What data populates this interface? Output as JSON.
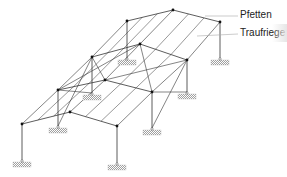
{
  "diagram": {
    "type": "structural-frame-isometric",
    "labels": [
      {
        "id": "pfetten",
        "text": "Pfetten",
        "x": 240,
        "y": 15
      },
      {
        "id": "traufriegel",
        "text": "Traufriege",
        "x": 240,
        "y": 33
      }
    ],
    "colors": {
      "line": "#333333",
      "leader": "#aaaaaa",
      "hatch": "#888888",
      "fade": "#e8e8e8"
    },
    "frames": [
      {
        "name": "front",
        "le": [
          22,
          124
        ],
        "ri": [
          70,
          112
        ],
        "re": [
          117,
          126
        ],
        "lb": [
          22,
          160
        ],
        "rb": [
          117,
          163
        ]
      },
      {
        "name": "frame2",
        "le": [
          58,
          90
        ],
        "ri": [
          105,
          80
        ],
        "re": [
          152,
          92
        ],
        "lb": [
          58,
          126
        ],
        "rb": [
          152,
          128
        ]
      },
      {
        "name": "frame3",
        "le": [
          92,
          57
        ],
        "ri": [
          140,
          44
        ],
        "re": [
          187,
          60
        ],
        "lb": [
          92,
          93
        ],
        "rb": [
          187,
          92
        ]
      },
      {
        "name": "back",
        "le": [
          127,
          21
        ],
        "ri": [
          173,
          10
        ],
        "re": [
          220,
          22
        ],
        "lb": [
          127,
          58
        ],
        "rb": [
          220,
          58
        ]
      }
    ]
  }
}
